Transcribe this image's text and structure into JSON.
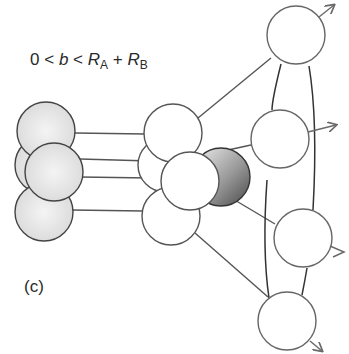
{
  "condition": {
    "lhs": "0",
    "lt1": "<",
    "var": "b",
    "lt2": "<",
    "RA_symbol": "R",
    "RA_sub": "A",
    "plus": "+",
    "RB_symbol": "R",
    "RB_sub": "B"
  },
  "panel_label": "(c)",
  "colors": {
    "stroke": "#555555",
    "arrow": "#6a6a6a",
    "shade_light": "#e6e6e6",
    "shade_dark": "#6e6e6e"
  },
  "nucleus_A": {
    "description": "projectile nucleus, shaded spheres, left",
    "spheres": 4
  },
  "overlap_zone": {
    "description": "participant spheres in collision zone, center",
    "spheres": 5
  },
  "spectators_B": {
    "description": "target fragments flying outward with arrows, right",
    "spheres": 4
  }
}
